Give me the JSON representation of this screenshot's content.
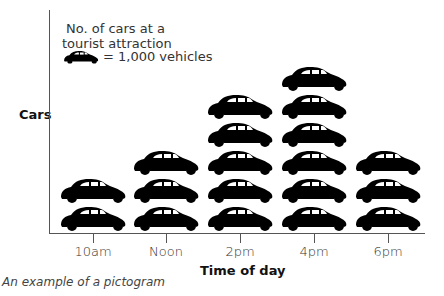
{
  "chart_data": {
    "type": "pictogram",
    "title": "No. of cars at a tourist attraction",
    "legend": {
      "icon": "car-icon",
      "value_label": "= 1,000 vehicles",
      "unit_value": 1000
    },
    "xlabel": "Time of  day",
    "ylabel": "Cars",
    "categories": [
      "10am",
      "Noon",
      "2pm",
      "4pm",
      "6pm"
    ],
    "icon_counts": [
      2,
      3,
      5,
      6,
      3
    ],
    "values": [
      2000,
      3000,
      5000,
      6000,
      3000
    ],
    "caption": "An example of a pictogram"
  },
  "legend": {
    "title_line1": "No. of cars at a",
    "title_line2": "tourist attraction",
    "equals": "= 1,000 vehicles"
  },
  "axes": {
    "ylabel": "Cars",
    "xlabel": "Time of  day"
  },
  "caption": "An example of a pictogram",
  "colors": {
    "icon": "#000000",
    "axis": "#555555",
    "text": "#333333"
  }
}
